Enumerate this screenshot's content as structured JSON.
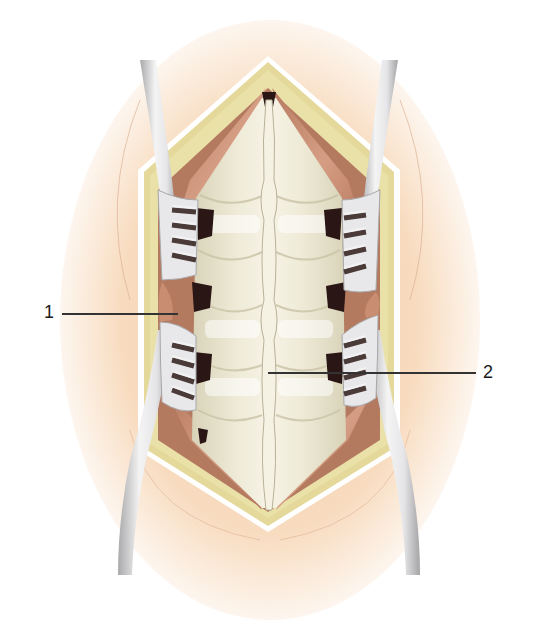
{
  "figure": {
    "colors": {
      "skin": "#f6d7b8",
      "skin_edge": "#ffffff",
      "fat_layer": "#e6dc9c",
      "muscle": "#c98e72",
      "muscle_dark": "#a86a52",
      "bone": "#ece7d2",
      "bone_shadow": "#cfc9ae",
      "spinous_process": "#f3f0e2",
      "foramen": "#2a1614",
      "retractor": "#e2e2e4",
      "retractor_shadow": "#9a9a9c",
      "leader_line": "#333333"
    }
  },
  "callouts": [
    {
      "number": "1",
      "target": "paraspinal muscle between retractor blades"
    },
    {
      "number": "2",
      "target": "spinous process / midline"
    }
  ]
}
